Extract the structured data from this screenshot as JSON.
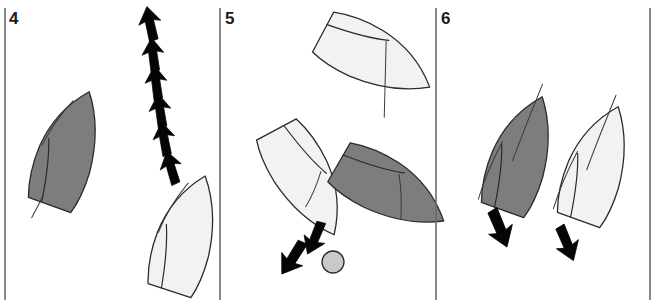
{
  "figure": {
    "width": 657,
    "height": 306,
    "background": "#ffffff",
    "colors": {
      "hull_dark": "#7d7d7d",
      "hull_light": "#f2f2f0",
      "outline": "#2b2b2b",
      "arrow": "#050505",
      "mark_buoy": "#c9c9c9",
      "divider": "#6b6b6b",
      "label": "#1a1a1a"
    }
  },
  "panels": [
    {
      "id": "panel-4",
      "number": "4",
      "number_x": 9,
      "number_y": 24,
      "divider_x": 5,
      "boats": [
        {
          "name": "dark-boat",
          "shade": "dark",
          "fill": "#7d7d7d",
          "cx": 68,
          "cy": 150,
          "rotation": 20,
          "scale": 1.0
        },
        {
          "name": "light-boat",
          "shade": "light",
          "fill": "#f2f2f0",
          "cx": 186,
          "cy": 235,
          "rotation": 18,
          "scale": 1.0
        }
      ],
      "arrows": {
        "name": "track-arrow-chain",
        "count": 6,
        "direction": "up",
        "points": [
          {
            "x": 171,
            "y": 168,
            "angle": -14
          },
          {
            "x": 164,
            "y": 139,
            "angle": -8
          },
          {
            "x": 160,
            "y": 111,
            "angle": -6
          },
          {
            "x": 156,
            "y": 83,
            "angle": -5
          },
          {
            "x": 153,
            "y": 55,
            "angle": -5
          },
          {
            "x": 150,
            "y": 24,
            "angle": -10
          }
        ]
      }
    },
    {
      "id": "panel-5",
      "number": "5",
      "number_x": 225,
      "number_y": 24,
      "divider_x": 220,
      "boats": [
        {
          "name": "light-boat-upper",
          "shade": "light",
          "fill": "#f2f2f0",
          "cx": 375,
          "cy": 58,
          "rotation": 118,
          "scale": 1.0
        },
        {
          "name": "light-boat-lower",
          "shade": "light",
          "fill": "#f2f2f0",
          "cx": 305,
          "cy": 180,
          "rotation": 152,
          "scale": 1.0
        },
        {
          "name": "dark-boat",
          "shade": "dark",
          "fill": "#7d7d7d",
          "cx": 390,
          "cy": 190,
          "rotation": 120,
          "scale": 1.0
        }
      ],
      "arrows": [
        {
          "name": "arrow-upper",
          "x": 315,
          "y": 238,
          "angle": 205,
          "scale": 1.15
        },
        {
          "name": "arrow-lower",
          "x": 293,
          "y": 258,
          "angle": 215,
          "scale": 1.25
        }
      ],
      "mark": {
        "name": "mark-buoy",
        "cx": 333,
        "cy": 262,
        "r": 11,
        "fill": "#c9c9c9"
      }
    },
    {
      "id": "panel-6",
      "number": "6",
      "number_x": 441,
      "number_y": 24,
      "divider_x": 436,
      "right_divider_x": 650,
      "boats": [
        {
          "name": "dark-boat",
          "shade": "dark",
          "fill": "#7d7d7d",
          "cx": 521,
          "cy": 155,
          "rotation": 20,
          "scale": 1.0
        },
        {
          "name": "light-boat",
          "shade": "light",
          "fill": "#f2f2f0",
          "cx": 597,
          "cy": 165,
          "rotation": 20,
          "scale": 1.0
        }
      ],
      "arrows": [
        {
          "name": "arrow-dark-boat",
          "x": 500,
          "y": 228,
          "angle": 160,
          "scale": 1.25
        },
        {
          "name": "arrow-light-boat",
          "x": 567,
          "y": 243,
          "angle": 160,
          "scale": 1.2
        }
      ]
    }
  ]
}
